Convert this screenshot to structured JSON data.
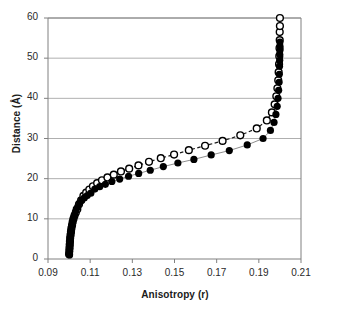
{
  "chart_data": {
    "type": "scatter",
    "title": "",
    "xlabel": "Anisotropy (r)",
    "ylabel": "Distance (Å)",
    "xlim": [
      0.09,
      0.21
    ],
    "ylim": [
      0,
      60
    ],
    "xticks": [
      "0.09",
      "0.11",
      "0.13",
      "0.15",
      "0.17",
      "0.19",
      "0.21"
    ],
    "xtick_values": [
      0.09,
      0.11,
      0.13,
      0.15,
      0.17,
      0.19,
      0.21
    ],
    "yticks": [
      "0",
      "10",
      "20",
      "30",
      "40",
      "50",
      "60"
    ],
    "ytick_values": [
      0,
      10,
      20,
      30,
      40,
      50,
      60
    ],
    "grid": "horizontal",
    "legend": "none",
    "colors": {
      "filled_marker": "#000000",
      "open_marker_edge": "#000000",
      "open_marker_fill": "#ffffff",
      "solid_line": "#808080",
      "dashed_line": "#1a1a1a",
      "gridline": "#9a9a9a",
      "axis": "#808080",
      "background": "#ffffff",
      "text": "#1a1a1a"
    },
    "series": [
      {
        "name": "filled-circles",
        "marker": "filled-circle",
        "line": "solid",
        "x": [
          0.1002,
          0.1002,
          0.1003,
          0.1004,
          0.1005,
          0.1006,
          0.1007,
          0.1009,
          0.1011,
          0.1013,
          0.1016,
          0.1019,
          0.1023,
          0.1028,
          0.1034,
          0.1041,
          0.105,
          0.106,
          0.1072,
          0.1086,
          0.1103,
          0.1122,
          0.1145,
          0.1172,
          0.1203,
          0.124,
          0.1282,
          0.133,
          0.1385,
          0.1447,
          0.1516,
          0.1592,
          0.1674,
          0.176,
          0.1845,
          0.192,
          0.1955,
          0.1972,
          0.1981,
          0.1987,
          0.1991,
          0.1994,
          0.1996,
          0.1997,
          0.1998,
          0.1999,
          0.1999,
          0.2,
          0.2,
          0.2
        ],
        "y": [
          1.0,
          1.8,
          2.6,
          3.4,
          4.2,
          5.0,
          5.8,
          6.6,
          7.4,
          8.2,
          9.0,
          9.8,
          10.5,
          11.2,
          12.4,
          13.0,
          14.0,
          14.6,
          15.2,
          15.8,
          16.4,
          17.4,
          18.0,
          18.6,
          19.3,
          19.9,
          20.6,
          21.3,
          22.1,
          23.0,
          23.9,
          24.8,
          25.9,
          27.0,
          28.4,
          30.0,
          32.0,
          34.0,
          36.0,
          38.0,
          40.0,
          42.0,
          44.0,
          46.0,
          48.0,
          49.5,
          51.0,
          52.0,
          53.0,
          54.0
        ]
      },
      {
        "name": "open-circles",
        "marker": "open-circle",
        "line": "dashed",
        "x": [
          0.1,
          0.1001,
          0.1002,
          0.1003,
          0.1004,
          0.1005,
          0.1007,
          0.1009,
          0.1011,
          0.1014,
          0.1017,
          0.1021,
          0.1026,
          0.1032,
          0.1039,
          0.1047,
          0.1057,
          0.1068,
          0.1081,
          0.1096,
          0.1113,
          0.1133,
          0.1156,
          0.1182,
          0.1212,
          0.1246,
          0.1285,
          0.1329,
          0.1379,
          0.1435,
          0.1498,
          0.1568,
          0.1645,
          0.1728,
          0.1812,
          0.189,
          0.1938,
          0.1962,
          0.1975,
          0.1983,
          0.1988,
          0.1992,
          0.1994,
          0.1996,
          0.1997,
          0.1998,
          0.1999,
          0.1999,
          0.2,
          0.2
        ],
        "y": [
          1.2,
          2.0,
          2.8,
          3.6,
          4.4,
          5.2,
          6.0,
          6.8,
          7.6,
          8.4,
          9.2,
          10.0,
          10.8,
          11.6,
          12.4,
          13.6,
          14.6,
          15.7,
          16.5,
          17.3,
          18.1,
          18.9,
          19.6,
          20.3,
          21.0,
          21.8,
          22.5,
          23.3,
          24.2,
          25.1,
          26.0,
          27.1,
          28.2,
          29.4,
          30.8,
          32.5,
          34.5,
          36.5,
          38.5,
          40.5,
          42.5,
          44.5,
          46.5,
          48.5,
          50.5,
          52.5,
          54.5,
          56.5,
          58.0,
          60.0
        ]
      }
    ]
  }
}
